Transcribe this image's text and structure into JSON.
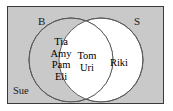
{
  "figure": {
    "type": "venn-diagram",
    "universe_fill": "#c9c9c9",
    "universe_border": "#3a3a3a",
    "left_circle_fill": "#c9c9c9",
    "right_circle_fill": "#ffffff",
    "intersection_fill": "#ffffff",
    "circle_stroke": "#555555",
    "text_color": "#1a1a1a"
  },
  "sets": {
    "left": {
      "label": "B",
      "members": [
        "Tia",
        "Amy",
        "Pam",
        "Eli"
      ]
    },
    "right": {
      "label": "S",
      "members": [
        "Riki"
      ]
    },
    "intersection": {
      "members": [
        "Tom",
        "Uri"
      ]
    },
    "outside": {
      "members": [
        "Sue"
      ]
    }
  }
}
